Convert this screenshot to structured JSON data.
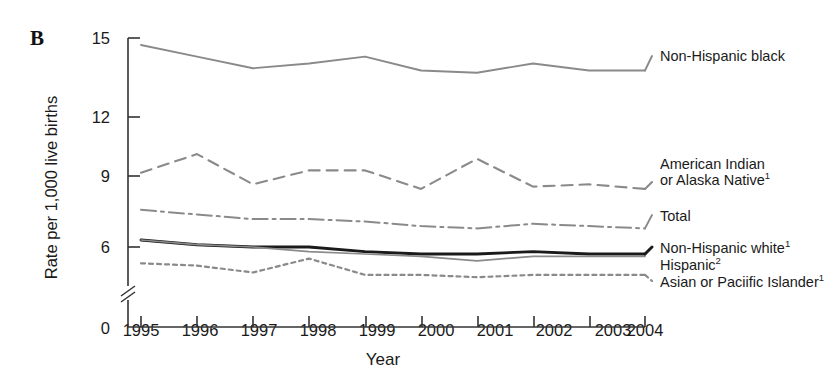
{
  "figure": {
    "panel_label": "B",
    "xlabel": "Year",
    "ylabel": "Rate per 1,000 live births"
  },
  "colors": {
    "gray_line": "#8a8a8a",
    "dark_line": "#1a1a1a",
    "axis": "#333333",
    "text": "#1a1a1a",
    "background": "#ffffff"
  },
  "axes": {
    "y_ticks": [
      "0",
      "6",
      "9",
      "12",
      "15"
    ],
    "x_ticks": [
      "1995",
      "1996",
      "1997",
      "1998",
      "1999",
      "2000",
      "2001",
      "2002",
      "2003",
      "2004"
    ],
    "y_axis_break": true,
    "grid": false
  },
  "legend": {
    "position": "right-inline",
    "entries": [
      {
        "label": "Non-Hispanic black",
        "style": "solid-gray"
      },
      {
        "label_line1": "American Indian",
        "label_line2": "or Alaska Native",
        "footnote": "1",
        "style": "dashed-gray"
      },
      {
        "label": "Total",
        "style": "dashdot-gray"
      },
      {
        "label": "Non-Hispanic white",
        "footnote": "1",
        "style": "solid-black-thick"
      },
      {
        "label": "Hispanic",
        "footnote": "2",
        "style": "solid-gray-thin"
      },
      {
        "label": "Asian or Paciific Islander",
        "footnote": "1",
        "style": "dotted-gray"
      }
    ]
  },
  "chart_data": {
    "type": "line",
    "title": "",
    "xlabel": "Year",
    "ylabel": "Rate per 1,000 live births",
    "x": [
      1995,
      1996,
      1997,
      1998,
      1999,
      2000,
      2001,
      2002,
      2003,
      2004
    ],
    "xlim": [
      1995,
      2004
    ],
    "ylim": [
      0,
      15
    ],
    "y_axis_break_between": [
      0,
      4
    ],
    "grid": false,
    "series": [
      {
        "name": "Non-Hispanic black",
        "footnote": "",
        "style": "solid",
        "color": "#8a8a8a",
        "values": [
          14.7,
          14.2,
          13.7,
          13.9,
          14.2,
          13.6,
          13.5,
          13.9,
          13.6,
          13.6
        ]
      },
      {
        "name": "American Indian or Alaska Native",
        "footnote": "1",
        "style": "dashed",
        "color": "#8a8a8a",
        "values": [
          9.2,
          10.0,
          8.7,
          9.3,
          9.3,
          8.5,
          9.8,
          8.6,
          8.7,
          8.5
        ]
      },
      {
        "name": "Total",
        "footnote": "",
        "style": "dashdot",
        "color": "#8a8a8a",
        "values": [
          7.6,
          7.4,
          7.2,
          7.2,
          7.1,
          6.9,
          6.8,
          7.0,
          6.9,
          6.8
        ]
      },
      {
        "name": "Non-Hispanic white",
        "footnote": "1",
        "style": "solid-thick",
        "color": "#1a1a1a",
        "values": [
          6.3,
          6.1,
          6.0,
          6.0,
          5.8,
          5.7,
          5.7,
          5.8,
          5.7,
          5.7
        ]
      },
      {
        "name": "Hispanic",
        "footnote": "2",
        "style": "solid-thin",
        "color": "#8a8a8a",
        "values": [
          6.3,
          6.1,
          6.0,
          5.8,
          5.7,
          5.6,
          5.4,
          5.6,
          5.6,
          5.6
        ]
      },
      {
        "name": "Asian or Paciific Islander",
        "footnote": "1",
        "style": "dotted",
        "color": "#8a8a8a",
        "values": [
          5.3,
          5.2,
          4.9,
          5.5,
          4.8,
          4.8,
          4.7,
          4.8,
          4.8,
          4.8
        ]
      }
    ]
  }
}
